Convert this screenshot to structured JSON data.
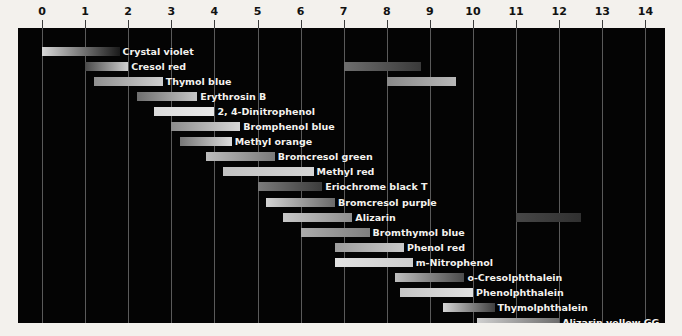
{
  "chart_data": {
    "type": "bar",
    "orientation": "horizontal-range",
    "title": "",
    "subtitle": "",
    "xlabel": "pH",
    "ylabel": "",
    "xlim": [
      0,
      14
    ],
    "grid": true,
    "legend": "none",
    "background_color": "#040404",
    "page_color": "#f3f1ed",
    "gridline_color": "#5a5a5a",
    "label_color": "#f4f2ee",
    "axis_text_color": "#111111",
    "xticks": [
      0,
      1,
      2,
      3,
      4,
      5,
      6,
      7,
      8,
      9,
      10,
      11,
      12,
      13,
      14
    ],
    "xtick_labels": [
      "0",
      "1",
      "2",
      "3",
      "4",
      "5",
      "6",
      "7",
      "8",
      "9",
      "10",
      "11",
      "12",
      "13",
      "14"
    ],
    "indicators": [
      {
        "name": "Crystal violet",
        "label_side": "right",
        "ranges": [
          {
            "start": 0.0,
            "end": 1.8,
            "from_color": "#d8d8d8",
            "to_color": "#1a1a1a"
          }
        ]
      },
      {
        "name": "Cresol red",
        "label_side": "right",
        "ranges": [
          {
            "start": 1.0,
            "end": 2.0,
            "from_color": "#4a4a4a",
            "to_color": "#d0d0d0"
          },
          {
            "start": 7.0,
            "end": 8.8,
            "from_color": "#6e6e6e",
            "to_color": "#3a3a3a"
          }
        ]
      },
      {
        "name": "Thymol blue",
        "label_side": "right",
        "ranges": [
          {
            "start": 1.2,
            "end": 2.8,
            "from_color": "#909090",
            "to_color": "#cfcfcf"
          },
          {
            "start": 8.0,
            "end": 9.6,
            "from_color": "#8a8a8a",
            "to_color": "#b8b8b8"
          }
        ]
      },
      {
        "name": "Erythrosin B",
        "label_side": "right",
        "ranges": [
          {
            "start": 2.2,
            "end": 3.6,
            "from_color": "#6f6f6f",
            "to_color": "#c6c6c6"
          }
        ]
      },
      {
        "name": "2, 4-Dinitrophenol",
        "label_side": "right",
        "ranges": [
          {
            "start": 2.6,
            "end": 4.0,
            "from_color": "#dadada",
            "to_color": "#e8e8e8"
          }
        ]
      },
      {
        "name": "Bromphenol blue",
        "label_side": "right",
        "ranges": [
          {
            "start": 3.0,
            "end": 4.6,
            "from_color": "#8c8c8c",
            "to_color": "#d6d6d6"
          }
        ]
      },
      {
        "name": "Methyl orange",
        "label_side": "right",
        "ranges": [
          {
            "start": 3.2,
            "end": 4.4,
            "from_color": "#777777",
            "to_color": "#dcdcdc"
          }
        ]
      },
      {
        "name": "Bromcresol green",
        "label_side": "right",
        "ranges": [
          {
            "start": 3.8,
            "end": 5.4,
            "from_color": "#bdbdbd",
            "to_color": "#7a7a7a"
          }
        ]
      },
      {
        "name": "Methyl red",
        "label_side": "right",
        "ranges": [
          {
            "start": 4.2,
            "end": 6.3,
            "from_color": "#c2c2c2",
            "to_color": "#d4d4d4"
          }
        ]
      },
      {
        "name": "Eriochrome black T",
        "label_side": "right",
        "ranges": [
          {
            "start": 5.0,
            "end": 6.5,
            "from_color": "#7b7b7b",
            "to_color": "#3c3c3c"
          }
        ]
      },
      {
        "name": "Bromcresol purple",
        "label_side": "right",
        "ranges": [
          {
            "start": 5.2,
            "end": 6.8,
            "from_color": "#d3d3d3",
            "to_color": "#6a6a6a"
          }
        ]
      },
      {
        "name": "Alizarin",
        "label_side": "right",
        "ranges": [
          {
            "start": 5.6,
            "end": 7.2,
            "from_color": "#c8c8c8",
            "to_color": "#8e8e8e"
          },
          {
            "start": 11.0,
            "end": 12.5,
            "from_color": "#474747",
            "to_color": "#303030"
          }
        ]
      },
      {
        "name": "Bromthymol blue",
        "label_side": "right",
        "ranges": [
          {
            "start": 6.0,
            "end": 7.6,
            "from_color": "#ababab",
            "to_color": "#7f7f7f"
          }
        ]
      },
      {
        "name": "Phenol red",
        "label_side": "right",
        "ranges": [
          {
            "start": 6.8,
            "end": 8.4,
            "from_color": "#9d9d9d",
            "to_color": "#c9c9c9"
          }
        ]
      },
      {
        "name": "m-Nitrophenol",
        "label_side": "right",
        "ranges": [
          {
            "start": 6.8,
            "end": 8.6,
            "from_color": "#e2e2e2",
            "to_color": "#cdcdcd"
          }
        ]
      },
      {
        "name": "o-Cresolphthalein",
        "label_side": "right",
        "ranges": [
          {
            "start": 8.2,
            "end": 9.8,
            "from_color": "#bebebe",
            "to_color": "#4b4b4b"
          }
        ]
      },
      {
        "name": "Phenolphthalein",
        "label_side": "right",
        "ranges": [
          {
            "start": 8.3,
            "end": 10.0,
            "from_color": "#c6c6c6",
            "to_color": "#e0e0e0"
          }
        ]
      },
      {
        "name": "Thymolphthalein",
        "label_side": "right",
        "ranges": [
          {
            "start": 9.3,
            "end": 10.5,
            "from_color": "#d5d5d5",
            "to_color": "#3f3f3f"
          }
        ]
      },
      {
        "name": "Alizarin yellow GG",
        "label_side": "right",
        "ranges": [
          {
            "start": 10.1,
            "end": 12.0,
            "from_color": "#cfcfcf",
            "to_color": "#6d6d6d"
          }
        ]
      }
    ]
  }
}
